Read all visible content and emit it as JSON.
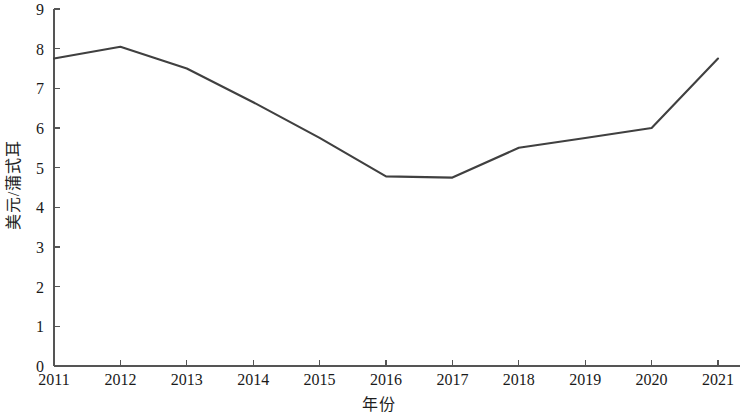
{
  "chart_data": {
    "type": "line",
    "title": "",
    "subtitle": "",
    "xlabel": "年份",
    "ylabel": "美元/蒲式耳",
    "categories": [
      "2011",
      "2012",
      "2013",
      "2014",
      "2015",
      "2016",
      "2017",
      "2018",
      "2019",
      "2020",
      "2021"
    ],
    "x": [
      2011,
      2012,
      2013,
      2014,
      2015,
      2016,
      2017,
      2018,
      2019,
      2020,
      2021
    ],
    "values": [
      7.75,
      8.05,
      7.5,
      6.65,
      5.75,
      4.78,
      4.75,
      5.5,
      5.75,
      6.0,
      7.75
    ],
    "series": [
      {
        "name": "美元/蒲式耳",
        "values": [
          7.75,
          8.05,
          7.5,
          6.65,
          5.75,
          4.78,
          4.75,
          5.5,
          5.75,
          6.0,
          7.75
        ]
      }
    ],
    "xlim": [
      2011,
      2021
    ],
    "ylim": [
      0,
      9
    ],
    "y_ticks": [
      0,
      1,
      2,
      3,
      4,
      5,
      6,
      7,
      8,
      9
    ],
    "y_tick_labels": [
      "0",
      "1",
      "2",
      "3",
      "4",
      "5",
      "6",
      "7",
      "8",
      "9"
    ],
    "x_ticks": [
      2011,
      2012,
      2013,
      2014,
      2015,
      2016,
      2017,
      2018,
      2019,
      2020,
      2021
    ],
    "x_tick_labels": [
      "2011",
      "2012",
      "2013",
      "2014",
      "2015",
      "2016",
      "2017",
      "2018",
      "2019",
      "2020",
      "2021"
    ],
    "grid": false,
    "legend": false,
    "legend_position": "none",
    "line_color": "#404040",
    "axis_color": "#555555",
    "background_color": "#ffffff",
    "line_width": 2.1,
    "markers": false,
    "annotations": []
  },
  "axes": {
    "y_title": "美元/蒲式耳",
    "x_title": "年份"
  }
}
